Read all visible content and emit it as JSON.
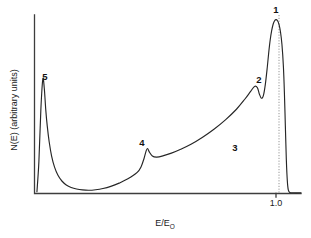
{
  "chart_data": {
    "type": "line",
    "title": "",
    "xlabel": "E/E",
    "xlabel_sub": "O",
    "ylabel": "N(E) (arbitrary units)",
    "xticks": [
      "1.0"
    ],
    "xtick_values": [
      1.0
    ],
    "xlim": [
      0.0,
      1.09
    ],
    "ylim": [
      0,
      1.0
    ],
    "grid": false,
    "legend": "none",
    "series": [
      {
        "name": "Electron energy distribution N(E)",
        "x": [
          0.01,
          0.018,
          0.026,
          0.034,
          0.04,
          0.046,
          0.052,
          0.06,
          0.07,
          0.082,
          0.096,
          0.112,
          0.13,
          0.15,
          0.172,
          0.196,
          0.222,
          0.25,
          0.28,
          0.312,
          0.346,
          0.382,
          0.42,
          0.436,
          0.448,
          0.456,
          0.462,
          0.47,
          0.482,
          0.5,
          0.528,
          0.56,
          0.598,
          0.64,
          0.686,
          0.734,
          0.782,
          0.826,
          0.86,
          0.884,
          0.9,
          0.912,
          0.92,
          0.928,
          0.936,
          0.944,
          0.952,
          0.958,
          0.964,
          0.97,
          0.976,
          0.982,
          0.988,
          0.994,
          1.0,
          1.006,
          1.012,
          1.018,
          1.022,
          1.026,
          1.03,
          1.034,
          1.038,
          1.044,
          1.06,
          1.09
        ],
        "y": [
          0.01,
          0.18,
          0.47,
          0.64,
          0.59,
          0.47,
          0.38,
          0.29,
          0.21,
          0.148,
          0.102,
          0.07,
          0.048,
          0.034,
          0.025,
          0.02,
          0.018,
          0.021,
          0.028,
          0.04,
          0.058,
          0.082,
          0.118,
          0.15,
          0.196,
          0.236,
          0.252,
          0.232,
          0.21,
          0.204,
          0.212,
          0.226,
          0.248,
          0.276,
          0.314,
          0.36,
          0.414,
          0.472,
          0.528,
          0.572,
          0.6,
          0.592,
          0.556,
          0.534,
          0.548,
          0.61,
          0.706,
          0.79,
          0.86,
          0.912,
          0.948,
          0.968,
          0.974,
          0.968,
          0.948,
          0.906,
          0.836,
          0.712,
          0.57,
          0.38,
          0.19,
          0.072,
          0.02,
          0.006,
          0.004,
          0.004
        ]
      }
    ],
    "annotations": [
      {
        "id": "peak-1",
        "label": "1",
        "x": 1.0,
        "y_px": 10,
        "description": "elastic peak"
      },
      {
        "id": "peak-2",
        "label": "2",
        "x": 0.905,
        "y_px": 80,
        "description": "plasmon loss peak"
      },
      {
        "id": "region-3",
        "label": "3",
        "x": 0.79,
        "y_px": 148,
        "description": "backscattered background"
      },
      {
        "id": "peak-4",
        "label": "4",
        "x": 0.455,
        "y_px": 143,
        "description": "Auger peak"
      },
      {
        "id": "peak-5",
        "label": "5",
        "x": 0.033,
        "y_px": 77,
        "description": "secondary electron peak"
      }
    ],
    "guides": [
      {
        "id": "elastic-guide",
        "x": 1.0,
        "style": "dotted",
        "from_y_px": 15,
        "to_y_px": 193
      }
    ]
  },
  "colors": {
    "curve": "#262626",
    "axis": "#3d3d3d",
    "guide": "#8a8a8a",
    "text": "#1a1a1a",
    "background": "#ffffff"
  }
}
